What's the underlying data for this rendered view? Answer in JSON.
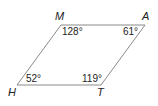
{
  "figure": {
    "type": "parallelogram",
    "stroke_color": "#8a8a8a",
    "vertices": [
      {
        "name": "M",
        "angle": "128°"
      },
      {
        "name": "A",
        "angle": "61°"
      },
      {
        "name": "T",
        "angle": "119°"
      },
      {
        "name": "H",
        "angle": "52°"
      }
    ]
  }
}
